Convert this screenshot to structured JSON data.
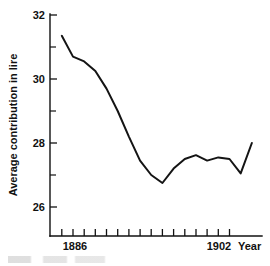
{
  "chart_data": {
    "type": "line",
    "title": "",
    "subtitle": "",
    "xlabel": "Year",
    "ylabel": "Average contribution in lire",
    "xlim": [
      1884,
      1903
    ],
    "ylim": [
      25.2,
      32
    ],
    "grid": false,
    "legend": null,
    "y_ticks_major": [
      26,
      28,
      30,
      32
    ],
    "y_ticks_minor": [
      27,
      29,
      31
    ],
    "y_tick_labels": [
      "26",
      "28",
      "30",
      "32"
    ],
    "x_tick_values": [
      1885,
      1886,
      1887,
      1888,
      1889,
      1890,
      1891,
      1892,
      1893,
      1894,
      1895,
      1896,
      1897,
      1898,
      1899,
      1900,
      1901,
      1902
    ],
    "x_tick_labels_shown": [
      "1886",
      "1902"
    ],
    "x_label_1886": "1886",
    "x_label_1902": "1902",
    "x_axis_unit": "Year",
    "series": [
      {
        "name": "Average contribution in lire",
        "color": "#141414",
        "x": [
          1885,
          1886,
          1887,
          1888,
          1889,
          1890,
          1891,
          1892,
          1893,
          1894,
          1895,
          1896,
          1897,
          1898,
          1899,
          1900,
          1901,
          1902
        ],
        "values": [
          31.35,
          30.7,
          30.55,
          30.25,
          29.7,
          29.0,
          28.2,
          27.45,
          27.0,
          26.75,
          27.2,
          27.5,
          27.62,
          27.45,
          27.55,
          27.5,
          27.05,
          28.0
        ]
      }
    ]
  },
  "axis": {
    "y_label": "Average contribution in lire",
    "y_tick_32": "32",
    "y_tick_30": "30",
    "y_tick_28": "28",
    "y_tick_26": "26",
    "x_tick_1886": "1886",
    "x_tick_1902": "1902",
    "x_unit": "Year"
  }
}
